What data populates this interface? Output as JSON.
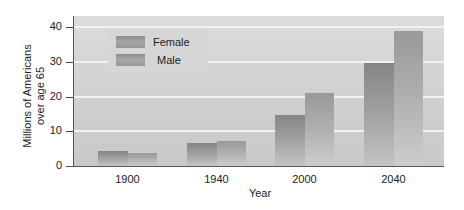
{
  "chart_data": {
    "type": "bar",
    "title": "",
    "xlabel": "Year",
    "ylabel": "Millions of Americans over age 65",
    "ylabel_lines": [
      "Millions of Americans",
      "over age 65"
    ],
    "categories": [
      "1900",
      "1940",
      "2000",
      "2040"
    ],
    "series": [
      {
        "name": "Female",
        "values": [
          4.3,
          6.6,
          14.7,
          29.7
        ]
      },
      {
        "name": "Male",
        "values": [
          3.7,
          7.2,
          21.0,
          39.0
        ]
      }
    ],
    "ylim": [
      0,
      42
    ],
    "yticks": [
      0,
      10,
      20,
      30,
      40
    ],
    "grid": true,
    "legend_position": "upper-left-inside",
    "colors": {
      "female": "#8a8a8a",
      "male": "#9c9c9c",
      "background": "#cfcfcf",
      "grid": "#f2f2f2"
    }
  }
}
